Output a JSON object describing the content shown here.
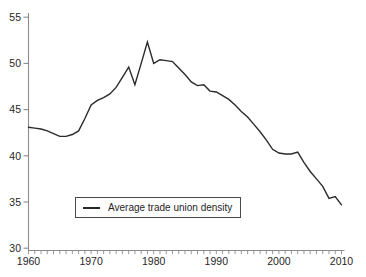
{
  "chart_data": {
    "type": "line",
    "title": "",
    "xlabel": "",
    "ylabel": "",
    "x": [
      1960,
      1961,
      1962,
      1963,
      1964,
      1965,
      1966,
      1967,
      1968,
      1969,
      1970,
      1971,
      1972,
      1973,
      1974,
      1975,
      1976,
      1977,
      1978,
      1979,
      1980,
      1981,
      1982,
      1983,
      1984,
      1985,
      1986,
      1987,
      1988,
      1989,
      1990,
      1991,
      1992,
      1993,
      1994,
      1995,
      1996,
      1997,
      1998,
      1999,
      2000,
      2001,
      2002,
      2003,
      2004,
      2005,
      2006,
      2007,
      2008,
      2009,
      2010
    ],
    "series": [
      {
        "name": "Average trade union density",
        "values": [
          43.1,
          43.0,
          42.9,
          42.7,
          42.4,
          42.1,
          42.1,
          42.3,
          42.7,
          44.0,
          45.5,
          46.0,
          46.3,
          46.7,
          47.4,
          48.5,
          49.6,
          47.7,
          50.0,
          52.3,
          50.0,
          50.4,
          50.3,
          50.2,
          49.5,
          48.8,
          48.0,
          47.6,
          47.7,
          47.0,
          46.9,
          46.5,
          46.1,
          45.5,
          44.8,
          44.2,
          43.4,
          42.6,
          41.7,
          40.7,
          40.3,
          40.2,
          40.2,
          40.4,
          39.3,
          38.3,
          37.5,
          36.7,
          35.4,
          35.6,
          34.7
        ]
      }
    ],
    "ylim": [
      30,
      55
    ],
    "xlim": [
      1960,
      2010
    ],
    "yticks": [
      "55",
      "50",
      "45",
      "40",
      "35",
      "30"
    ],
    "ytick_values": [
      55,
      50,
      45,
      40,
      35,
      30
    ],
    "xticks": [
      "1960",
      "1970",
      "1980",
      "1990",
      "2000",
      "2010"
    ],
    "xtick_values": [
      1960,
      1970,
      1980,
      1990,
      2000,
      2010
    ],
    "minor_tick_interval": 1,
    "grid": false,
    "legend": {
      "label": "Average trade union density",
      "position": "bottom-center-left",
      "border": true
    },
    "line_color": "#2b2b2b",
    "axis_color": "#8c8c8c",
    "label_color": "#262626"
  }
}
